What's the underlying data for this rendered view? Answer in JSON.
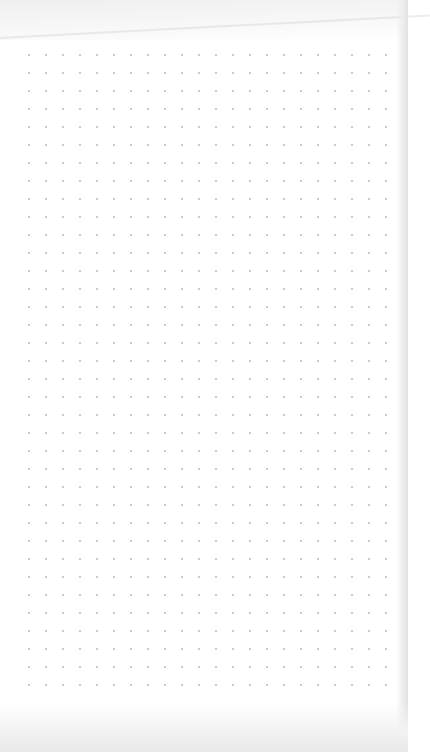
{
  "scene": {
    "subject": "blank dot-grid notebook page",
    "paper_color": "#ffffff",
    "dot_color": "#b9b9b9"
  },
  "grid": {
    "origin_x": 28,
    "origin_y": 54,
    "spacing_x": 17,
    "spacing_y": 18,
    "columns": 22,
    "rows": 36
  }
}
